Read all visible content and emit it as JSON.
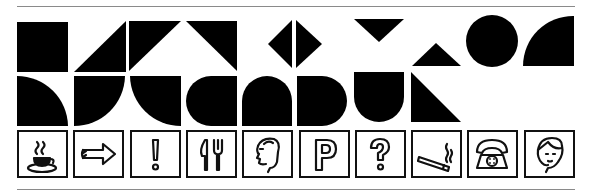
{
  "colors": {
    "ink": "#000000",
    "rule": "#8a8a8a",
    "background": "#ffffff"
  },
  "shapes_row_1": [
    "square",
    "triangle-bottom-right",
    "triangle-top-left",
    "triangle-top-right",
    "diamond-split",
    "triangle-down",
    "triangle-up",
    "circle",
    "quarter-circle"
  ],
  "shapes_row_2": [
    "quarter-circle-top-left",
    "quarter-circle-bottom-left",
    "quarter-circle-bottom-right",
    "rounded-left-block",
    "arch",
    "rounded-right-block",
    "u-shape",
    "triangle-bottom-left"
  ],
  "icons": [
    {
      "name": "coffee-cup",
      "label": "Café"
    },
    {
      "name": "arrow-right",
      "label": "Direction"
    },
    {
      "name": "exclamation",
      "label": "Attention"
    },
    {
      "name": "knife-fork",
      "label": "Restaurant"
    },
    {
      "name": "man-head",
      "label": "Men"
    },
    {
      "name": "parking-p",
      "label": "Parking"
    },
    {
      "name": "question-mark",
      "label": "Information"
    },
    {
      "name": "cigarette",
      "label": "Smoking"
    },
    {
      "name": "telephone",
      "label": "Telephone"
    },
    {
      "name": "woman-head",
      "label": "Women"
    }
  ]
}
